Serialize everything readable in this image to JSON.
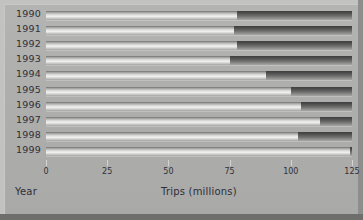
{
  "chart_data": {
    "type": "bar",
    "orientation": "horizontal",
    "title": "",
    "xlabel": "Trips (millions)",
    "ylabel": "Year",
    "categories": [
      "1990",
      "1991",
      "1992",
      "1993",
      "1994",
      "1995",
      "1996",
      "1997",
      "1998",
      "1999"
    ],
    "values": [
      78,
      77,
      78,
      75,
      90,
      100,
      104,
      112,
      103,
      124
    ],
    "series": [
      {
        "name": "Trips (millions)",
        "values": [
          78,
          77,
          78,
          75,
          90,
          100,
          104,
          112,
          103,
          124
        ]
      }
    ],
    "xlim": [
      0,
      125
    ],
    "xticks": [
      0,
      25,
      50,
      75,
      100,
      125
    ],
    "xtick_labels": [
      "0",
      "25",
      "50",
      "75",
      "100",
      "125"
    ],
    "grid": false,
    "legend": false,
    "legend_position": "none",
    "bar_fill_color": "#e8e8e6",
    "bar_track_color": "#4a4a4a",
    "background_color": "#aeaeac",
    "text_color": "#2e2e38"
  },
  "axis": {
    "x_title": "Trips (millions)",
    "y_title": "Year"
  }
}
